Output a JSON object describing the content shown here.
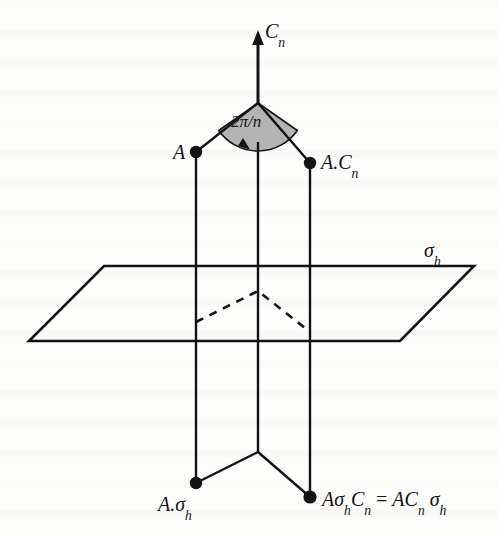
{
  "figure": {
    "kind": "geometric-diagram",
    "background_color": "#fdfdfc",
    "ink_color": "#131313",
    "wedge_fill_color": "#b4b4b4",
    "labels": {
      "axis": {
        "base": "C",
        "sub": "n"
      },
      "point_a": {
        "base": "A",
        "sub": ""
      },
      "point_a_cn": {
        "base": "A.C",
        "sub": "n"
      },
      "plane": {
        "base": "σ",
        "sub": "h"
      },
      "point_a_sigmah": {
        "base": "A.σ",
        "sub": "h"
      },
      "point_a_sigmah_cn": {
        "text": "AσhCn = ACn σh"
      },
      "angle": {
        "text": "2π/n"
      }
    },
    "geometry": {
      "axis_arrow": {
        "x": 258,
        "y_tip": 32,
        "y_base": 103
      },
      "apex": {
        "x": 258,
        "y": 103
      },
      "wedge_radius": 48,
      "wedge_start_angle_deg": 215,
      "wedge_end_angle_deg": 325,
      "points": [
        {
          "name": "A",
          "x": 196,
          "y": 152
        },
        {
          "name": "A.Cn",
          "x": 310,
          "y": 163
        },
        {
          "name": "A.sigma_h",
          "x": 196,
          "y": 483
        },
        {
          "name": "A.sigma_h.Cn",
          "x": 310,
          "y": 497
        }
      ],
      "verticals": [
        {
          "x": 196,
          "y1": 152,
          "y2": 483
        },
        {
          "x": 258,
          "y1": 142,
          "y2": 452
        },
        {
          "x": 310,
          "y1": 163,
          "y2": 497
        }
      ],
      "plane_corners": [
        {
          "x": 104,
          "y": 266
        },
        {
          "x": 474,
          "y": 266
        },
        {
          "x": 400,
          "y": 341
        },
        {
          "x": 29,
          "y": 341
        }
      ],
      "dashed_chevron": [
        {
          "x": 196,
          "y": 322
        },
        {
          "x": 258,
          "y": 291
        },
        {
          "x": 310,
          "y": 332
        }
      ],
      "top_chevron": [
        {
          "x": 196,
          "y": 152
        },
        {
          "x": 258,
          "y": 103
        },
        {
          "x": 310,
          "y": 163
        }
      ],
      "bottom_chevron": [
        {
          "x": 196,
          "y": 483
        },
        {
          "x": 258,
          "y": 452
        },
        {
          "x": 310,
          "y": 497
        }
      ]
    }
  }
}
